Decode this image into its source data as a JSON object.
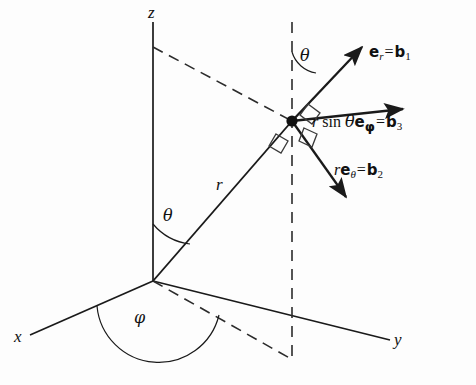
{
  "figure": {
    "background_color": "#fdfdfd",
    "line_color": "#1a1a1a",
    "width": 476,
    "height": 385
  },
  "axes": [
    {
      "name": "z-axis",
      "label": "z",
      "from": [
        153,
        281
      ],
      "to": [
        153,
        22
      ]
    },
    {
      "name": "x-axis",
      "label": "x",
      "from": [
        153,
        281
      ],
      "to": [
        30,
        335
      ]
    },
    {
      "name": "y-axis",
      "label": "y",
      "from": [
        153,
        281
      ],
      "to": [
        390,
        340
      ]
    }
  ],
  "labels": {
    "z_axis": "z",
    "x_axis": "x",
    "y_axis": "y",
    "radius": "r",
    "theta_origin": "θ",
    "theta_point": "θ",
    "phi": "φ"
  },
  "point": {
    "name": "point-p",
    "position": [
      292,
      121
    ],
    "marker": "filled-dot"
  },
  "vectors": [
    {
      "name": "e-r-vector",
      "from": [
        292,
        121
      ],
      "to": [
        366,
        43
      ],
      "label_parts": {
        "vec": "e",
        "vec_sub": "r",
        "equals": "=",
        "basis": "b",
        "basis_sub": "1"
      },
      "label_text": "e_r = b_1",
      "label_position": [
        372,
        52
      ]
    },
    {
      "name": "e-phi-vector",
      "from": [
        292,
        121
      ],
      "to": [
        408,
        108
      ],
      "label_parts": {
        "scalar": "r",
        "func": "sin",
        "angle": "θ",
        "vec": "e",
        "vec_sub": "φ",
        "equals": "=",
        "basis": "b",
        "basis_sub": "3"
      },
      "label_text": "r sin θe_φ = b_3",
      "label_position": [
        314,
        122
      ]
    },
    {
      "name": "e-theta-vector",
      "from": [
        292,
        121
      ],
      "to": [
        350,
        203
      ],
      "label_parts": {
        "scalar": "r",
        "vec": "e",
        "vec_sub": "θ",
        "equals": "=",
        "basis": "b",
        "basis_sub": "2"
      },
      "label_text": "re_θ = b_2",
      "label_position": [
        336,
        170
      ]
    }
  ],
  "lines": {
    "radial_line": {
      "name": "radius-line",
      "from": [
        153,
        281
      ],
      "to": [
        292,
        121
      ],
      "style": "solid",
      "label": "r",
      "label_position": [
        219,
        180
      ]
    },
    "dashed_top": {
      "name": "z-axis-to-point-dashed",
      "from": [
        153,
        47
      ],
      "to": [
        292,
        121
      ],
      "style": "dashed"
    },
    "dashed_vertical": {
      "name": "vertical-dashed-line",
      "from": [
        292,
        22
      ],
      "to": [
        292,
        360
      ],
      "style": "dashed"
    },
    "dashed_projection": {
      "name": "origin-to-foot-dashed",
      "from": [
        153,
        281
      ],
      "to": [
        293,
        360
      ],
      "style": "dashed"
    }
  },
  "angles": [
    {
      "name": "theta-angle-origin",
      "label": "θ",
      "label_position": [
        165,
        214
      ],
      "between": [
        "z-axis",
        "radius-line"
      ]
    },
    {
      "name": "theta-angle-point",
      "label": "θ",
      "label_position": [
        302,
        54
      ],
      "between": [
        "vertical-dashed-line",
        "e-r-vector"
      ]
    },
    {
      "name": "phi-angle",
      "label": "φ",
      "label_position": [
        138,
        316
      ],
      "between": [
        "x-axis",
        "origin-to-foot-dashed"
      ]
    }
  ],
  "right_angle_markers": [
    {
      "name": "right-angle-marker-upper",
      "between": [
        "e-r-vector",
        "e-phi-vector"
      ]
    },
    {
      "name": "right-angle-marker-lower",
      "between": [
        "e-phi-vector",
        "e-theta-vector"
      ]
    },
    {
      "name": "right-angle-marker-left",
      "between": [
        "e-theta-vector",
        "radius-line"
      ]
    }
  ]
}
